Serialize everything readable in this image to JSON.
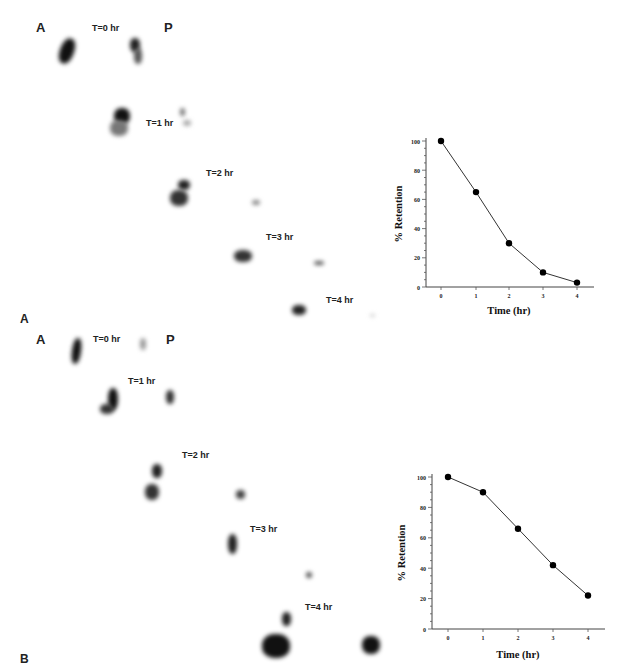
{
  "panels": [
    {
      "id": "A",
      "panel_label": "A",
      "view_labels": {
        "anterior": "A",
        "posterior": "P"
      },
      "time_labels": [
        "T=0 hr",
        "T=1 hr",
        "T=2 hr",
        "T=3 hr",
        "T=4 hr"
      ]
    },
    {
      "id": "B",
      "panel_label": "B",
      "view_labels": {
        "anterior": "A",
        "posterior": "P"
      },
      "time_labels": [
        "T=0 hr",
        "T=1 hr",
        "T=2 hr",
        "T=3 hr",
        "T=4 hr"
      ]
    }
  ],
  "chart_data": [
    {
      "type": "line",
      "panel": "A",
      "title": "",
      "xlabel": "Time (hr)",
      "ylabel": "% Retention",
      "x": [
        0,
        1,
        2,
        3,
        4
      ],
      "values": [
        100,
        65,
        30,
        10,
        3
      ],
      "xticks": [
        "0",
        "1",
        "2",
        "3",
        "4"
      ],
      "yticks": [
        "0",
        "20",
        "40",
        "60",
        "80",
        "100"
      ],
      "ylim": [
        0,
        100
      ],
      "grid": false,
      "marker": "filled-circle",
      "line_color": "#333333"
    },
    {
      "type": "line",
      "panel": "B",
      "title": "",
      "xlabel": "Time (hr)",
      "ylabel": "% Retention",
      "x": [
        0,
        1,
        2,
        3,
        4
      ],
      "values": [
        100,
        90,
        66,
        42,
        22
      ],
      "xticks": [
        "0",
        "1",
        "2",
        "3",
        "4"
      ],
      "yticks": [
        "0",
        "20",
        "40",
        "60",
        "80",
        "100"
      ],
      "ylim": [
        0,
        100
      ],
      "grid": false,
      "marker": "filled-circle",
      "line_color": "#333333"
    }
  ]
}
